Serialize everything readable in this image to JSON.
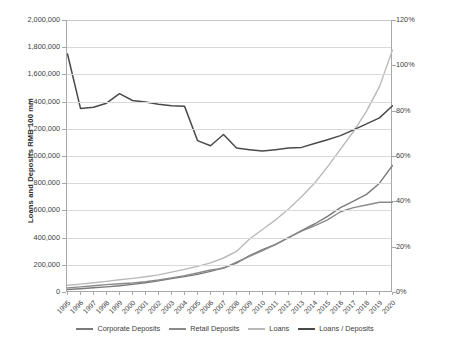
{
  "chart_data": {
    "type": "line",
    "title": "",
    "xlabel": "",
    "ylabel": "Loans and Deposits RMB 100 mm",
    "y2label": "Loans to Deposits %",
    "grid": true,
    "legend_position": "bottom",
    "ylim": [
      0,
      2000000
    ],
    "y2lim": [
      0,
      1.2
    ],
    "yticks": [
      0,
      200000,
      400000,
      600000,
      800000,
      1000000,
      1200000,
      1400000,
      1600000,
      1800000,
      2000000
    ],
    "ytick_labels": [
      "0",
      "200,000",
      "400,000",
      "600,000",
      "800,000",
      "1,000,000",
      "1,200,000",
      "1,400,000",
      "1,600,000",
      "1,800,000",
      "2,000,000"
    ],
    "y2ticks": [
      0,
      0.2,
      0.4,
      0.6,
      0.8,
      1.0,
      1.2
    ],
    "y2tick_labels": [
      "0%",
      "20%",
      "40%",
      "60%",
      "80%",
      "100%",
      "120%"
    ],
    "categories": [
      "1995",
      "1996",
      "1997",
      "1998",
      "1999",
      "2000",
      "2001",
      "2002",
      "2003",
      "2004",
      "2005",
      "2006",
      "2007",
      "2008",
      "2009",
      "2010",
      "2011",
      "2012",
      "2013",
      "2014",
      "2015",
      "2016",
      "2017",
      "2018",
      "2019",
      "2020"
    ],
    "series": [
      {
        "name": "Corporate Deposits",
        "axis": "left",
        "color": "#7a7a7a",
        "values": [
          18000,
          24000,
          31000,
          38000,
          46000,
          56000,
          68000,
          82000,
          98000,
          113000,
          130000,
          152000,
          178000,
          212000,
          268000,
          312000,
          350000,
          400000,
          452000,
          500000,
          556000,
          620000,
          668000,
          718000,
          800000,
          930000
        ]
      },
      {
        "name": "Retail Deposits",
        "axis": "left",
        "color": "#8a8a8a",
        "values": [
          30000,
          38000,
          46000,
          54000,
          61000,
          66000,
          75000,
          88000,
          104000,
          120000,
          140000,
          162000,
          174000,
          220000,
          262000,
          305000,
          348000,
          400000,
          448000,
          486000,
          530000,
          590000,
          620000,
          640000,
          660000,
          660000
        ]
      },
      {
        "name": "Loans",
        "axis": "left",
        "color": "#b9b9b9",
        "values": [
          50000,
          58000,
          68000,
          78000,
          90000,
          100000,
          112000,
          126000,
          146000,
          166000,
          188000,
          214000,
          250000,
          298000,
          390000,
          460000,
          530000,
          610000,
          700000,
          800000,
          920000,
          1050000,
          1180000,
          1330000,
          1510000,
          1780000
        ]
      },
      {
        "name": "Loans / Deposits",
        "axis": "right",
        "color": "#4a4a4a",
        "values": [
          1.05,
          0.81,
          0.815,
          0.833,
          0.875,
          0.845,
          0.838,
          0.828,
          0.822,
          0.82,
          0.668,
          0.645,
          0.695,
          0.635,
          0.628,
          0.622,
          0.628,
          0.635,
          0.638,
          0.655,
          0.672,
          0.69,
          0.715,
          0.742,
          0.768,
          0.822
        ]
      }
    ]
  },
  "legend": {
    "items": [
      {
        "label": "Corporate Deposits",
        "color": "#7a7a7a"
      },
      {
        "label": "Retail Deposits",
        "color": "#8a8a8a"
      },
      {
        "label": "Loans",
        "color": "#b9b9b9"
      },
      {
        "label": "Loans / Deposits",
        "color": "#4a4a4a"
      }
    ]
  }
}
